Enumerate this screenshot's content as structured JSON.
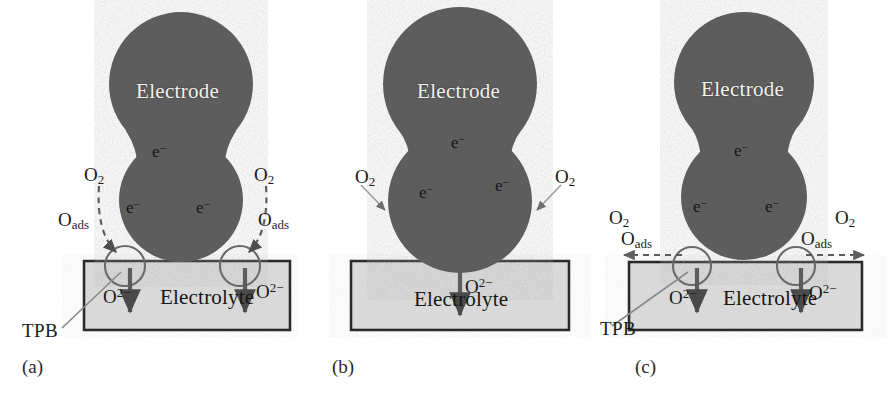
{
  "figure": {
    "electrode_label": "Electrode",
    "electrolyte_label": "Electrolyte",
    "electron_label": "e−",
    "oxygen_gas_label": "O2",
    "oxygen_adsorbed_label": "Oads",
    "oxide_ion_label": "O2−",
    "tpb_label": "TPB",
    "colors": {
      "electrode_fill": "#5d5d5d",
      "electrolyte_fill": "#d9d9d9",
      "outline": "#2b2b2b",
      "arrow": "#555555",
      "electrode_text": "#f4f2ee",
      "background": "#ffffff"
    }
  },
  "panels": [
    {
      "id": "a",
      "caption": "(a)",
      "electrode": "Electrode",
      "electrolyte": "Electrolyte",
      "electrons": [
        "e−",
        "e−",
        "e−"
      ],
      "o2_left": "O2",
      "o2_right": "O2",
      "oads_left": "Oads",
      "oads_right": "Oads",
      "oion_left": "O2−",
      "oion_right": "O2−",
      "tpb": "TPB",
      "arrow_style": "curved-dashed",
      "tpb_circles": 2,
      "oion_arrows": 2
    },
    {
      "id": "b",
      "caption": "(b)",
      "electrode": "Electrode",
      "electrolyte": "Electrolyte",
      "electrons": [
        "e−",
        "e−",
        "e−"
      ],
      "o2_left": "O2",
      "o2_right": "O2",
      "oads_left": "",
      "oads_right": "",
      "oion_center": "O2−",
      "tpb": "",
      "arrow_style": "straight-solid",
      "tpb_circles": 0,
      "oion_arrows": 1
    },
    {
      "id": "c",
      "caption": "(c)",
      "electrode": "Electrode",
      "electrolyte": "Electrolyte",
      "electrons": [
        "e−",
        "e−",
        "e−"
      ],
      "o2_left": "O2",
      "o2_right": "O2",
      "oads_left": "Oads",
      "oads_right": "Oads",
      "oion_left": "O2−",
      "oion_right": "O2−",
      "tpb": "TPB",
      "arrow_style": "horizontal-dashed",
      "tpb_circles": 2,
      "oion_arrows": 2
    }
  ]
}
